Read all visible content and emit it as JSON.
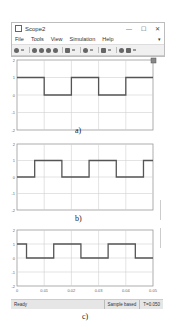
{
  "window": {
    "title": "Scope2",
    "controls": {
      "minimize": "—",
      "maximize": "☐",
      "close": "✕"
    }
  },
  "menu": {
    "items": [
      "File",
      "Tools",
      "View",
      "Simulation",
      "Help"
    ],
    "overflow": "▾"
  },
  "toolbar": {
    "icons": [
      "settings-icon",
      "step-back-icon",
      "stop-icon",
      "run-icon",
      "step-forward-icon",
      "record-icon",
      "highlight-icon",
      "zoom-icon",
      "autoscale-icon",
      "trigger-icon",
      "measurements-icon"
    ]
  },
  "status": {
    "ready": "Ready",
    "mode": "Sample based",
    "time": "T=0.050"
  },
  "captions": {
    "a": "a)",
    "b": "b)",
    "c": "c)"
  },
  "axes": {
    "y_ticks": [
      "2",
      "1",
      "0",
      "-1",
      "-2"
    ],
    "x_ticks": [
      "0",
      "0.01",
      "0.02",
      "0.03",
      "0.04",
      "0.05"
    ]
  },
  "chart_data": [
    {
      "type": "line",
      "title": "a)",
      "xlabel": "",
      "ylabel": "",
      "xlim": [
        0,
        0.05
      ],
      "ylim": [
        -2,
        2
      ],
      "grid": true,
      "y_ticks": [
        2,
        1,
        0,
        -1,
        -2
      ],
      "series": [
        {
          "name": "square wave a",
          "step": true,
          "x": [
            0,
            0.01,
            0.01,
            0.02,
            0.02,
            0.03,
            0.03,
            0.04,
            0.04,
            0.05
          ],
          "values": [
            1,
            1,
            0,
            0,
            1,
            1,
            0,
            0,
            1,
            1
          ]
        }
      ]
    },
    {
      "type": "line",
      "title": "b)",
      "xlabel": "",
      "ylabel": "",
      "xlim": [
        0,
        0.05
      ],
      "ylim": [
        -2,
        2
      ],
      "grid": true,
      "y_ticks": [
        2,
        1,
        0,
        -1,
        -2
      ],
      "series": [
        {
          "name": "square wave b",
          "step": true,
          "x": [
            0,
            0.0065,
            0.0065,
            0.0165,
            0.0165,
            0.0265,
            0.0265,
            0.0365,
            0.0365,
            0.0465,
            0.0465,
            0.05
          ],
          "values": [
            0,
            0,
            1,
            1,
            0,
            0,
            1,
            1,
            0,
            0,
            1,
            1
          ]
        }
      ]
    },
    {
      "type": "line",
      "title": "c)",
      "xlabel": "",
      "ylabel": "",
      "xlim": [
        0,
        0.05
      ],
      "ylim": [
        -2,
        2
      ],
      "grid": true,
      "x_ticks": [
        0,
        0.01,
        0.02,
        0.03,
        0.04,
        0.05
      ],
      "y_ticks": [
        2,
        1,
        0,
        -1,
        -2
      ],
      "series": [
        {
          "name": "square wave c",
          "step": true,
          "x": [
            0,
            0.0035,
            0.0035,
            0.0135,
            0.0135,
            0.0235,
            0.0235,
            0.0335,
            0.0335,
            0.0435,
            0.0435,
            0.05
          ],
          "values": [
            1,
            1,
            0,
            0,
            1,
            1,
            0,
            0,
            1,
            1,
            0,
            0
          ]
        }
      ]
    }
  ]
}
